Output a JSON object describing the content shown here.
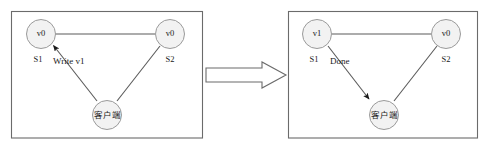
{
  "figure": {
    "type": "diagram",
    "panels": [
      {
        "id": "before",
        "nodes": [
          {
            "id": "s1",
            "value": "v0",
            "name": "S1",
            "role": "server"
          },
          {
            "id": "s2",
            "value": "v0",
            "name": "S2",
            "role": "server"
          },
          {
            "id": "client",
            "value": "客户端",
            "name": "",
            "role": "client"
          }
        ],
        "edges": [
          {
            "from": "s1",
            "to": "s2",
            "label": "",
            "arrow": "none"
          },
          {
            "from": "client",
            "to": "s1",
            "label": "Write v1",
            "arrow": "to"
          },
          {
            "from": "client",
            "to": "s2",
            "label": "",
            "arrow": "none"
          }
        ]
      },
      {
        "id": "after",
        "nodes": [
          {
            "id": "s1",
            "value": "v1",
            "name": "S1",
            "role": "server"
          },
          {
            "id": "s2",
            "value": "v0",
            "name": "S2",
            "role": "server"
          },
          {
            "id": "client",
            "value": "客户端",
            "name": "",
            "role": "client"
          }
        ],
        "edges": [
          {
            "from": "s1",
            "to": "s2",
            "label": "",
            "arrow": "none"
          },
          {
            "from": "s1",
            "to": "client",
            "label": "Done",
            "arrow": "to"
          },
          {
            "from": "client",
            "to": "s2",
            "label": "",
            "arrow": "none"
          }
        ]
      }
    ],
    "transition": {
      "icon": "right-block-arrow",
      "label": ""
    },
    "colors": {
      "panel_border": "#6b6b6b",
      "node_fill": "#f2f2f2",
      "node_stroke": "#9a9a9a",
      "edge": "#5a5a5a",
      "text": "#1a1a1a",
      "background": "#ffffff"
    }
  }
}
